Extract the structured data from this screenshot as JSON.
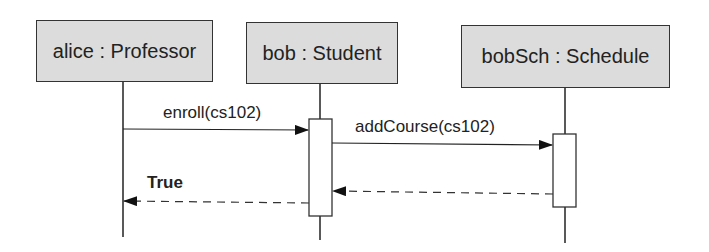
{
  "diagram": {
    "type": "UML sequence diagram",
    "lifelines": [
      {
        "id": "alice",
        "label": "alice : Professor"
      },
      {
        "id": "bob",
        "label": "bob : Student"
      },
      {
        "id": "bobSch",
        "label": "bobSch : Schedule"
      }
    ],
    "messages": [
      {
        "from": "alice",
        "to": "bob",
        "label": "enroll(cs102)",
        "kind": "synchronous call"
      },
      {
        "from": "bob",
        "to": "bobSch",
        "label": "addCourse(cs102)",
        "kind": "synchronous call"
      },
      {
        "from": "bobSch",
        "to": "bob",
        "label": "",
        "kind": "return"
      },
      {
        "from": "bob",
        "to": "alice",
        "label": "True",
        "kind": "return"
      }
    ]
  }
}
